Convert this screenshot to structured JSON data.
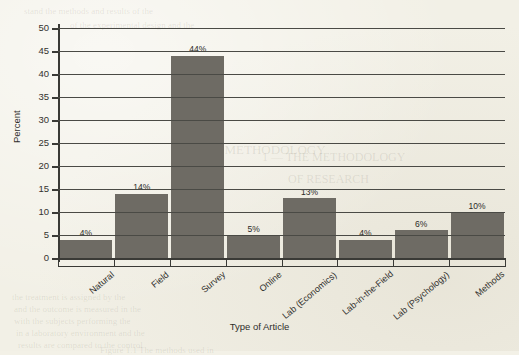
{
  "chart_data": {
    "type": "bar",
    "title": "",
    "xlabel": "Type of Article",
    "ylabel": "Percent",
    "categories": [
      "Natural",
      "Field",
      "Survey",
      "Online",
      "Lab (Economics)",
      "Lab-in-the-Field",
      "Lab (Psychology)",
      "Methods"
    ],
    "values": [
      4,
      14,
      44,
      5,
      13,
      4,
      6,
      10
    ],
    "data_labels": [
      "4%",
      "14%",
      "44%",
      "5%",
      "13%",
      "4%",
      "6%",
      "10%"
    ],
    "ylim": [
      0,
      50
    ],
    "ytick_values": [
      0,
      5,
      10,
      15,
      20,
      25,
      30,
      35,
      40,
      45,
      50
    ],
    "ytick_labels": [
      "0",
      "5",
      "10",
      "15",
      "20",
      "25",
      "30",
      "35",
      "40",
      "45",
      "50"
    ],
    "grid": true,
    "legend": false,
    "bar_color": "#6e6b64",
    "grid_color": "#4a4a45",
    "axis_color": "#3a3a36",
    "background_color": "#f2f0e6"
  },
  "ghost_text": [
    {
      "text": "stand the methods and results of the",
      "x": 24,
      "y": 6,
      "size": 9
    },
    {
      "text": "of the experimental design and the",
      "x": 70,
      "y": 20,
      "size": 9
    },
    {
      "text": "THE METHODOLOGY",
      "x": 196,
      "y": 142,
      "size": 13
    },
    {
      "text": "1 — THE METHODOLOGY",
      "x": 262,
      "y": 150,
      "size": 12
    },
    {
      "text": "OF RESEARCH",
      "x": 288,
      "y": 172,
      "size": 12
    },
    {
      "text": "the treatment is assigned by the",
      "x": 12,
      "y": 292,
      "size": 9
    },
    {
      "text": "and the outcome is measured in the",
      "x": 14,
      "y": 304,
      "size": 9
    },
    {
      "text": "with the subjects performing the",
      "x": 14,
      "y": 316,
      "size": 9
    },
    {
      "text": "in a laboratory environment and the",
      "x": 16,
      "y": 328,
      "size": 9
    },
    {
      "text": "results are compared to the control",
      "x": 18,
      "y": 340,
      "size": 9
    },
    {
      "text": "Figure 1.1 The methods used in",
      "x": 100,
      "y": 345,
      "size": 9
    }
  ]
}
